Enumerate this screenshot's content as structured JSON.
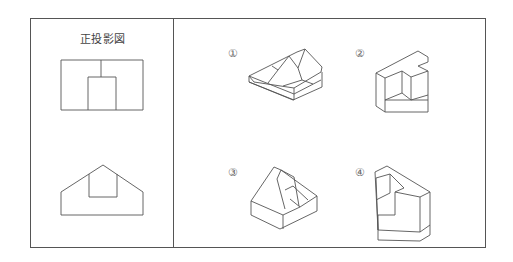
{
  "diagram": {
    "left_panel": {
      "title": "正投影図",
      "views": [
        "front-view",
        "top-view"
      ]
    },
    "right_panel": {
      "options": [
        {
          "label": "①",
          "name": "option-1"
        },
        {
          "label": "②",
          "name": "option-2"
        },
        {
          "label": "③",
          "name": "option-3"
        },
        {
          "label": "④",
          "name": "option-4"
        }
      ]
    },
    "colors": {
      "line": "#555555",
      "background": "#ffffff"
    }
  }
}
